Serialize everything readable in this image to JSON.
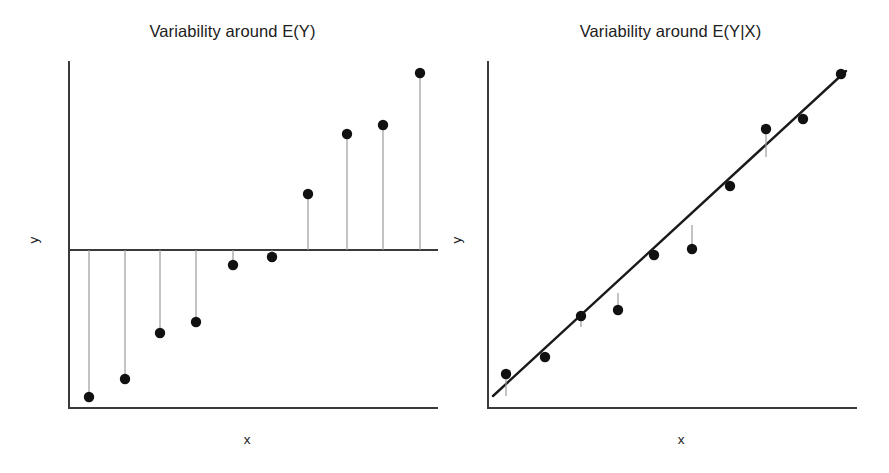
{
  "figure": {
    "width": 889,
    "height": 473,
    "background": "#ffffff",
    "point_color": "#111111",
    "axis_color": "#3a3a3a",
    "residual_color": "#9b9b9b",
    "regression_color": "#1a1a1a"
  },
  "panels": [
    {
      "id": "left",
      "title": "Variability around E(Y)",
      "xlabel": "x",
      "ylabel": "y"
    },
    {
      "id": "right",
      "title": "Variability around E(Y|X)",
      "xlabel": "x",
      "ylabel": "y"
    }
  ],
  "chart_data": [
    {
      "type": "scatter",
      "title": "Variability around E(Y)",
      "xlabel": "x",
      "ylabel": "y",
      "grid": false,
      "legend": "none",
      "axis_ticks": "none",
      "description": "Stem plot showing deviations of each observation from the overall mean E(Y), drawn as a horizontal reference line. Vertical grey segments connect each point to the mean line.",
      "reference": {
        "kind": "horizontal-mean-line",
        "label": "E(Y)",
        "y_pixel": 250
      },
      "axes_pixels": {
        "y_axis_x": 69,
        "x_axis_y": 408,
        "y_axis_top": 62,
        "x_axis_right": 437
      },
      "x": [
        1,
        2,
        3,
        4,
        5,
        6,
        7,
        8,
        9,
        10
      ],
      "y": [
        -8.0,
        -7.2,
        -4.2,
        -3.5,
        -0.9,
        -0.4,
        2.6,
        5.2,
        5.6,
        8.0
      ],
      "points_pixels": [
        {
          "x": 89,
          "y": 397
        },
        {
          "x": 125,
          "y": 379
        },
        {
          "x": 160,
          "y": 333
        },
        {
          "x": 196,
          "y": 322
        },
        {
          "x": 233,
          "y": 265
        },
        {
          "x": 272,
          "y": 257
        },
        {
          "x": 308,
          "y": 194
        },
        {
          "x": 347,
          "y": 134
        },
        {
          "x": 383,
          "y": 125
        },
        {
          "x": 420,
          "y": 73
        }
      ]
    },
    {
      "type": "scatter",
      "title": "Variability around E(Y|X)",
      "xlabel": "x",
      "ylabel": "y",
      "grid": false,
      "legend": "none",
      "axis_ticks": "none",
      "description": "Scatter plot with a fitted regression line E(Y|X). Short grey residual segments connect points to the line; most points lie close to the fit.",
      "reference": {
        "kind": "regression-line",
        "label": "E(Y|X)",
        "x1_pixel": 493,
        "y1_pixel": 396,
        "x2_pixel": 846,
        "y2_pixel": 71
      },
      "axes_pixels": {
        "y_axis_x": 488,
        "x_axis_y": 408,
        "y_axis_top": 62,
        "x_axis_right": 856
      },
      "x": [
        1,
        2,
        3,
        4,
        5,
        6,
        7,
        8,
        9,
        10
      ],
      "y": [
        0.8,
        1.7,
        2.7,
        3.1,
        4.8,
        5.3,
        6.9,
        8.5,
        8.8,
        10.0
      ],
      "points_pixels": [
        {
          "x": 506,
          "y": 374,
          "fit_y": 396
        },
        {
          "x": 545,
          "y": 357,
          "fit_y": 360
        },
        {
          "x": 581,
          "y": 316,
          "fit_y": 327
        },
        {
          "x": 618,
          "y": 310,
          "fit_y": 293
        },
        {
          "x": 654,
          "y": 255,
          "fit_y": 260
        },
        {
          "x": 692,
          "y": 249,
          "fit_y": 225
        },
        {
          "x": 730,
          "y": 186,
          "fit_y": 190
        },
        {
          "x": 766,
          "y": 129,
          "fit_y": 157
        },
        {
          "x": 803,
          "y": 119,
          "fit_y": 123
        },
        {
          "x": 841,
          "y": 74,
          "fit_y": 78
        }
      ]
    }
  ]
}
